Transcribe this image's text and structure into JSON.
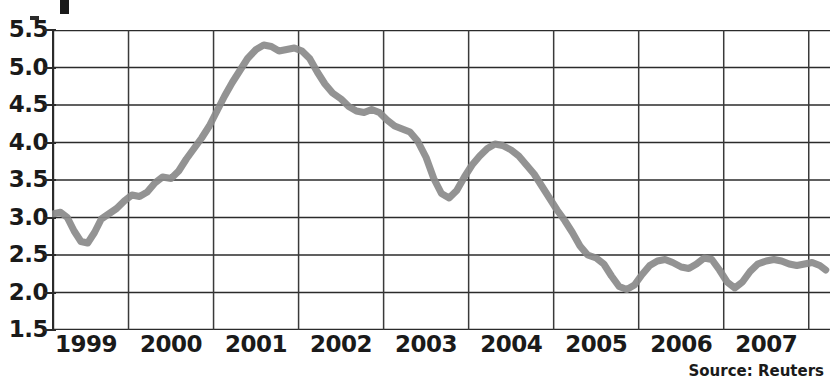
{
  "source_note": "Source: Reuters",
  "chart_data": {
    "type": "line",
    "title": "",
    "xlabel": "",
    "ylabel": "",
    "ylim": [
      1.5,
      5.5
    ],
    "ytick_labels": [
      "5.5",
      "5.0",
      "4.5",
      "4.0",
      "3.5",
      "3.0",
      "2.5",
      "2.0",
      "1.5"
    ],
    "ytick_values": [
      5.5,
      5.0,
      4.5,
      4.0,
      3.5,
      3.0,
      2.5,
      2.0,
      1.5
    ],
    "xtick_labels": [
      "1999",
      "2000",
      "2001",
      "2002",
      "2003",
      "2004",
      "2005",
      "2006",
      "2007"
    ],
    "xlim": [
      1998.6,
      2007.75
    ],
    "grid": "both",
    "legend": "none",
    "line_color": "#8a8a8a",
    "line_width": 7,
    "series": [
      {
        "name": "series-1",
        "x": [
          1998.62,
          1998.7,
          1998.78,
          1998.86,
          1998.94,
          1999.02,
          1999.1,
          1999.18,
          1999.27,
          1999.36,
          1999.45,
          1999.54,
          1999.63,
          1999.72,
          1999.81,
          1999.9,
          2000.0,
          2000.09,
          2000.18,
          2000.27,
          2000.36,
          2000.45,
          2000.54,
          2000.63,
          2000.72,
          2000.81,
          2000.9,
          2001.0,
          2001.09,
          2001.18,
          2001.27,
          2001.36,
          2001.45,
          2001.54,
          2001.63,
          2001.72,
          2001.81,
          2001.9,
          2002.0,
          2002.09,
          2002.18,
          2002.27,
          2002.36,
          2002.45,
          2002.54,
          2002.63,
          2002.72,
          2002.81,
          2002.9,
          2003.0,
          2003.09,
          2003.18,
          2003.27,
          2003.36,
          2003.45,
          2003.54,
          2003.63,
          2003.72,
          2003.81,
          2003.9,
          2004.0,
          2004.09,
          2004.18,
          2004.27,
          2004.36,
          2004.45,
          2004.54,
          2004.63,
          2004.72,
          2004.81,
          2004.9,
          2005.0,
          2005.09,
          2005.18,
          2005.27,
          2005.36,
          2005.45,
          2005.54,
          2005.63,
          2005.72,
          2005.81,
          2005.9,
          2006.0,
          2006.09,
          2006.18,
          2006.27,
          2006.36,
          2006.45,
          2006.54,
          2006.63,
          2006.72,
          2006.81,
          2006.9,
          2007.0,
          2007.09,
          2007.18,
          2007.27,
          2007.36,
          2007.45,
          2007.54,
          2007.63,
          2007.7
        ],
        "y": [
          3.05,
          3.07,
          3.0,
          2.82,
          2.68,
          2.66,
          2.8,
          2.98,
          3.05,
          3.12,
          3.22,
          3.3,
          3.28,
          3.34,
          3.46,
          3.54,
          3.52,
          3.62,
          3.78,
          3.92,
          4.06,
          4.22,
          4.42,
          4.62,
          4.8,
          4.96,
          5.12,
          5.24,
          5.3,
          5.28,
          5.22,
          5.24,
          5.26,
          5.22,
          5.12,
          4.94,
          4.78,
          4.66,
          4.58,
          4.48,
          4.42,
          4.4,
          4.44,
          4.4,
          4.3,
          4.22,
          4.18,
          4.14,
          4.02,
          3.8,
          3.52,
          3.32,
          3.26,
          3.36,
          3.54,
          3.7,
          3.82,
          3.92,
          3.98,
          3.96,
          3.9,
          3.82,
          3.7,
          3.58,
          3.42,
          3.26,
          3.1,
          2.96,
          2.8,
          2.62,
          2.5,
          2.46,
          2.38,
          2.22,
          2.08,
          2.04,
          2.1,
          2.24,
          2.36,
          2.42,
          2.44,
          2.4,
          2.34,
          2.32,
          2.38,
          2.46,
          2.44,
          2.3,
          2.14,
          2.06,
          2.14,
          2.28,
          2.38,
          2.42,
          2.44,
          2.42,
          2.38,
          2.36,
          2.38,
          2.4,
          2.36,
          2.3
        ]
      }
    ]
  }
}
